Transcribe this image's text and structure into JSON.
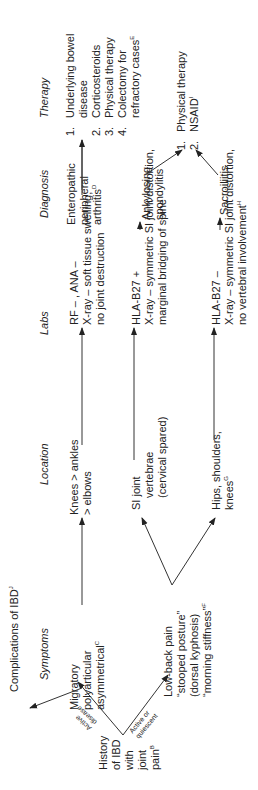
{
  "headers": {
    "symptoms": "Symptoms",
    "location": "Location",
    "labs": "Labs",
    "diagnosis": "Diagnosis",
    "therapy": "Therapy"
  },
  "start": {
    "lines": [
      "History",
      "of IBD",
      "with",
      "joint",
      "pain"
    ],
    "sup": "B"
  },
  "branch_labels": {
    "active_1": "Active",
    "active_2": "disease",
    "quiescent_1": "Active or",
    "quiescent_2": "quiescent"
  },
  "complications": {
    "text": "Complications of IBD",
    "sup": "J"
  },
  "row1": {
    "symptoms": [
      "Migratory",
      "polyarticular",
      "asymmetrical"
    ],
    "symptoms_sup": "C",
    "location": [
      "Knees > ankles",
      "> elbows"
    ],
    "labs": [
      "RF – , ANA –",
      "X-ray – soft tissue swelling,",
      "no joint destruction"
    ],
    "diagnosis": [
      "Enteropathic",
      "peripheral",
      "arthritis"
    ],
    "diagnosis_sup": "D"
  },
  "therapy1": {
    "items": [
      {
        "num": "1.",
        "lines": [
          "Underlying bowel",
          "disease"
        ]
      },
      {
        "num": "2.",
        "lines": [
          "Corticosteroids"
        ]
      },
      {
        "num": "3.",
        "lines": [
          "Physical therapy"
        ]
      },
      {
        "num": "4.",
        "lines": [
          "Colectomy for",
          "refractory cases"
        ],
        "sup": "E"
      }
    ]
  },
  "row2": {
    "symptoms": [
      "Low-back pain",
      "“stooped posture”",
      "(dorsal kyphosis)",
      "“morning stiffness”"
    ],
    "symptoms_sup": "F",
    "location": [
      "SI joint",
      "vertebrae",
      "(cervical spared)"
    ],
    "labs": [
      "HLA-B27 +",
      "X-ray – symmetric SI joint distortion,",
      "marginal bridging of spine"
    ],
    "diagnosis": [
      "Ankylosing",
      "spondylitis"
    ]
  },
  "row3": {
    "location": [
      "Hips, shoulders,",
      "knees"
    ],
    "location_sup": "G",
    "labs": [
      "HLA-B27 –",
      "X-ray – symmetric SI joint distortion,",
      "no vertebral involvement"
    ],
    "labs_sup": "H",
    "diagnosis": [
      "Sacroiliitis"
    ]
  },
  "therapy2": {
    "items": [
      {
        "num": "1.",
        "lines": [
          "Physical therapy"
        ]
      },
      {
        "num": "2.",
        "lines": [
          "NSAID"
        ],
        "sup": "I"
      }
    ]
  }
}
